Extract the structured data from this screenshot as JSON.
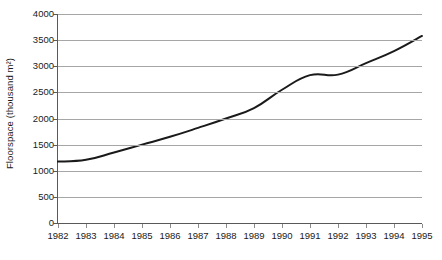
{
  "chart_data": {
    "type": "line",
    "title": "",
    "xlabel": "",
    "ylabel": "Floorspace (thousand m²)",
    "categories": [
      1982,
      1983,
      1984,
      1985,
      1986,
      1987,
      1988,
      1989,
      1990,
      1991,
      1992,
      1993,
      1994,
      1995
    ],
    "x_tick_labels": [
      "1982",
      "1983",
      "1984",
      "1985",
      "1986",
      "1987",
      "1988",
      "1989",
      "1990",
      "1991",
      "1992",
      "1993",
      "1994",
      "1995"
    ],
    "values": [
      1175,
      1210,
      1350,
      1500,
      1650,
      1820,
      2000,
      2200,
      2550,
      2830,
      2840,
      3060,
      3290,
      3580
    ],
    "series": [
      {
        "name": "Floorspace",
        "values": [
          1175,
          1210,
          1350,
          1500,
          1650,
          1820,
          2000,
          2200,
          2550,
          2830,
          2840,
          3060,
          3290,
          3580
        ]
      }
    ],
    "xlim": [
      1982,
      1995
    ],
    "ylim": [
      0,
      4000
    ],
    "y_tick_labels": [
      "0",
      "500",
      "1000",
      "1500",
      "2000",
      "2500",
      "3000",
      "3500",
      "4000"
    ],
    "y_ticks": [
      0,
      500,
      1000,
      1500,
      2000,
      2500,
      3000,
      3500,
      4000
    ],
    "y_tick_step": 500,
    "grid": "horizontal",
    "legend": "none",
    "line_color": "#1a1a1a",
    "grid_color": "#a6a6a6",
    "axis_color": "#595959",
    "background_color": "#ffffff",
    "line_width": 2,
    "markers": "none",
    "annotations": []
  }
}
